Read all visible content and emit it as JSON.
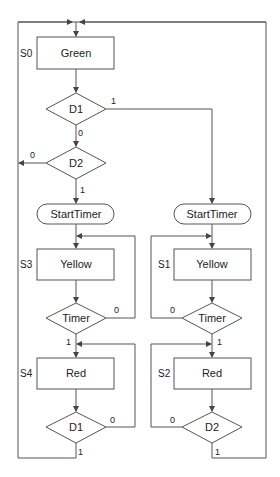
{
  "diagram": {
    "type": "ASM chart",
    "colors": {
      "stroke": "#555555",
      "background": "#ffffff",
      "text": "#222222"
    },
    "states": [
      {
        "id": "S0",
        "label": "S0",
        "output": "Green"
      },
      {
        "id": "S3",
        "label": "S3",
        "output": "Yellow"
      },
      {
        "id": "S1",
        "label": "S1",
        "output": "Yellow"
      },
      {
        "id": "S4",
        "label": "S4",
        "output": "Red"
      },
      {
        "id": "S2",
        "label": "S2",
        "output": "Red"
      }
    ],
    "decisions": [
      {
        "id": "d1_top",
        "condition": "D1"
      },
      {
        "id": "d2_top",
        "condition": "D2"
      },
      {
        "id": "timer_left",
        "condition": "Timer"
      },
      {
        "id": "timer_right",
        "condition": "Timer"
      },
      {
        "id": "d1_bottom",
        "condition": "D1"
      },
      {
        "id": "d2_bottom",
        "condition": "D2"
      }
    ],
    "conditional_outputs": [
      {
        "id": "start_left",
        "label": "StartTimer"
      },
      {
        "id": "start_right",
        "label": "StartTimer"
      }
    ],
    "edge_labels": {
      "d1_top_true": "1",
      "d1_top_false": "0",
      "d2_top_true": "1",
      "d2_top_false": "0",
      "timer_left_false": "0",
      "timer_left_true": "1",
      "timer_right_false": "0",
      "timer_right_true": "1",
      "d1_bottom_false": "0",
      "d1_bottom_true": "1",
      "d2_bottom_false": "0",
      "d2_bottom_true": "1"
    }
  }
}
